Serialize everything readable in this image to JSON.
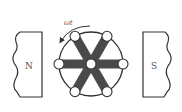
{
  "diagram": {
    "left_pole": {
      "label": "N"
    },
    "right_pole": {
      "label": "S"
    },
    "rotation": {
      "label": "ωt",
      "direction": "counter-clockwise"
    },
    "wheel": {
      "spokes": 6,
      "nodes": 7
    },
    "colors": {
      "line": "#333333",
      "spoke": "#4a4a4a",
      "node_fill": "#ffffff",
      "text": "#555555"
    }
  }
}
